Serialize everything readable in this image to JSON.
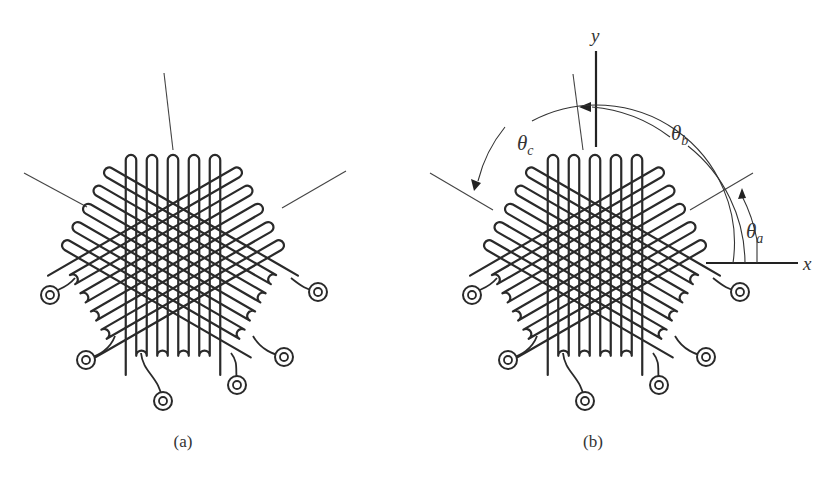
{
  "figure": {
    "panels": [
      {
        "id": "a",
        "caption": "(a)",
        "center": [
          173,
          258
        ],
        "show_axes": false
      },
      {
        "id": "b",
        "caption": "(b)",
        "center": [
          595,
          258
        ],
        "show_axes": true
      }
    ],
    "rosette": {
      "type": "delta strain gauge rosette",
      "grid_angles_deg": [
        90,
        30,
        150
      ],
      "loops_per_grid": 5,
      "strand_spacing": 10.5,
      "grid_half_length": 103,
      "loop_radius": 5.2,
      "pad_count": 6
    },
    "axes": {
      "x_label": "x",
      "y_label": "y"
    },
    "angle_labels": {
      "theta_a": {
        "symbol": "θ",
        "subscript": "a"
      },
      "theta_b": {
        "symbol": "θ",
        "subscript": "b"
      },
      "theta_c": {
        "symbol": "θ",
        "subscript": "c"
      }
    },
    "colors": {
      "ink": "#2a2a2a",
      "background": "#ffffff"
    }
  }
}
